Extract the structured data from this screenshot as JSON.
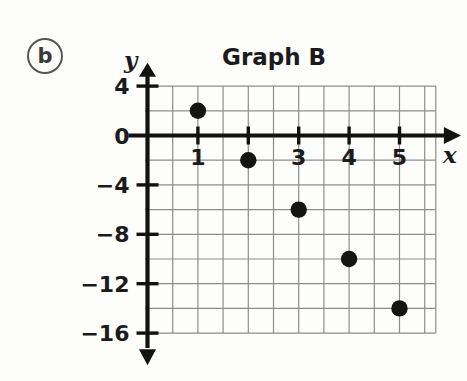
{
  "part_label": "b",
  "chart_data": {
    "type": "scatter",
    "title": "Graph B",
    "xlabel": "x",
    "ylabel": "y",
    "x": [
      1,
      2,
      3,
      4,
      5
    ],
    "values": [
      2,
      -2,
      -6,
      -10,
      -14
    ],
    "points": [
      {
        "x": 1,
        "y": 2
      },
      {
        "x": 2,
        "y": -2
      },
      {
        "x": 3,
        "y": -6
      },
      {
        "x": 4,
        "y": -10
      },
      {
        "x": 5,
        "y": -14
      }
    ],
    "xlim": [
      -0.5,
      6.0
    ],
    "ylim": [
      -16,
      4
    ],
    "x_ticks": [
      1,
      2,
      3,
      4,
      5
    ],
    "x_tick_labels": [
      "1",
      "",
      "3",
      "4",
      "5"
    ],
    "y_ticks": [
      4,
      0,
      -4,
      -8,
      -12,
      -16
    ],
    "y_tick_labels": [
      "4",
      "0",
      "−4",
      "−8",
      "−12",
      "−16"
    ],
    "grid": true,
    "grid_x_step": 0.5,
    "grid_y_step": 2,
    "legend": null,
    "marker": "filled-circle",
    "marker_color": "#141414",
    "axis_color": "#121212",
    "grid_color": "#8d8d8d"
  }
}
